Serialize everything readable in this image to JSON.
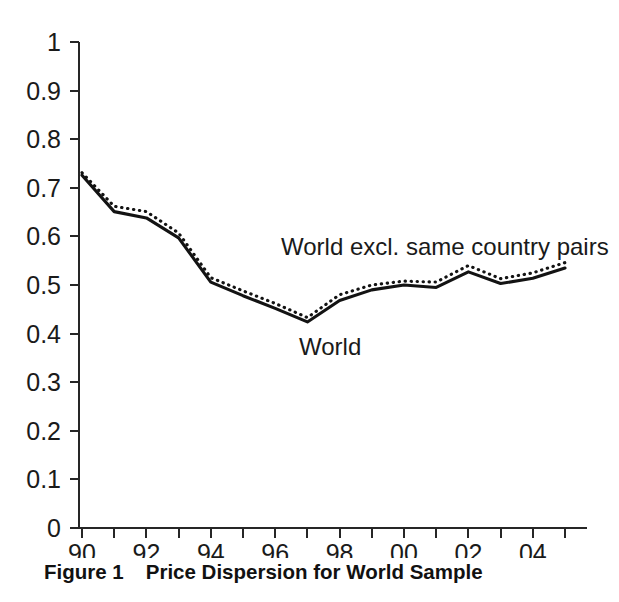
{
  "figure": {
    "caption_number": "Figure 1",
    "caption_title": "Price Dispersion for World Sample"
  },
  "annotations": {
    "series_upper_label": "World excl. same country pairs",
    "series_lower_label": "World"
  },
  "chart_data": {
    "type": "line",
    "title": "Price Dispersion for World Sample",
    "xlabel": "",
    "ylabel": "",
    "x": [
      1990,
      1991,
      1992,
      1993,
      1994,
      1995,
      1996,
      1997,
      1998,
      1999,
      2000,
      2001,
      2002,
      2003,
      2004,
      2005
    ],
    "x_tick_labels": [
      "90",
      "",
      "92",
      "",
      "94",
      "",
      "96",
      "",
      "98",
      "",
      "00",
      "",
      "02",
      "",
      "04",
      ""
    ],
    "x_labeled_ticks": [
      "90",
      "92",
      "94",
      "96",
      "98",
      "00",
      "02",
      "04"
    ],
    "y_tick_labels": [
      "0",
      "0.1",
      "0.2",
      "0.3",
      "0.4",
      "0.5",
      "0.6",
      "0.7",
      "0.8",
      "0.9",
      "1"
    ],
    "ylim": [
      0,
      1
    ],
    "xlim": [
      1990,
      2005
    ],
    "grid": false,
    "legend_position": "inline-annotation",
    "series": [
      {
        "name": "World",
        "style": "solid",
        "values": [
          0.726,
          0.651,
          0.638,
          0.597,
          0.506,
          0.478,
          0.452,
          0.424,
          0.468,
          0.49,
          0.5,
          0.495,
          0.527,
          0.503,
          0.514,
          0.535
        ]
      },
      {
        "name": "World excl. same country pairs",
        "style": "dotted",
        "values": [
          0.731,
          0.662,
          0.651,
          0.607,
          0.515,
          0.488,
          0.462,
          0.433,
          0.48,
          0.5,
          0.508,
          0.506,
          0.54,
          0.513,
          0.525,
          0.546
        ]
      }
    ]
  },
  "colors": {
    "line": "#131313",
    "axis": "#262626",
    "text": "#1a1a1a",
    "background": "#ffffff"
  }
}
